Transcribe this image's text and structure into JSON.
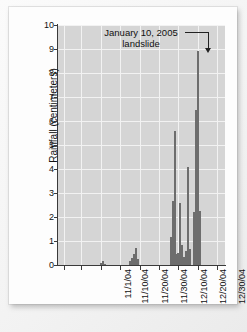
{
  "figure": {
    "background_color": "#fdfdfd",
    "plot_background_color": "#d5d5d5",
    "gridline_color": "#f2f2f2",
    "bar_color": "#6d6d6d",
    "axis_color": "#3a3a3a"
  },
  "annotation": {
    "line1": "January 10, 2005",
    "line2": "landslide"
  },
  "chart_data": {
    "type": "bar",
    "title": "",
    "subtitle": "",
    "xlabel": "",
    "ylabel": "Rainfall (centimeters)",
    "ylim": [
      0,
      10
    ],
    "ytick_labels": [
      "0",
      "1",
      "2",
      "3",
      "4",
      "5",
      "6",
      "7",
      "8",
      "9",
      "10"
    ],
    "ytick_values": [
      0,
      1,
      2,
      3,
      4,
      5,
      6,
      7,
      8,
      9,
      10
    ],
    "xtick_labels": [
      "11/1/04",
      "11/10/04",
      "11/20/04",
      "11/30/04",
      "12/10/04",
      "12/20/04",
      "12/30/04",
      "1/9/05",
      "1/19/05"
    ],
    "xtick_days": [
      0,
      9,
      19,
      29,
      39,
      49,
      59,
      69,
      79
    ],
    "xlim_days": [
      -3,
      83
    ],
    "grid": true,
    "legend": null,
    "annotations": [
      {
        "text": "January 10, 2005 landslide",
        "points_to_day": 70,
        "points_to_value": 8.9,
        "arrow": "down"
      }
    ],
    "categories": [
      "11/1/04",
      "11/2/04",
      "11/3/04",
      "11/4/04",
      "11/5/04",
      "11/6/04",
      "11/7/04",
      "11/8/04",
      "11/9/04",
      "11/10/04",
      "11/11/04",
      "11/12/04",
      "11/13/04",
      "11/14/04",
      "11/15/04",
      "11/16/04",
      "11/17/04",
      "11/18/04",
      "11/19/04",
      "11/20/04",
      "11/21/04",
      "11/22/04",
      "11/23/04",
      "11/24/04",
      "11/25/04",
      "11/26/04",
      "11/27/04",
      "11/28/04",
      "11/29/04",
      "11/30/04",
      "12/1/04",
      "12/2/04",
      "12/3/04",
      "12/4/04",
      "12/5/04",
      "12/6/04",
      "12/7/04",
      "12/8/04",
      "12/9/04",
      "12/10/04",
      "12/11/04",
      "12/12/04",
      "12/13/04",
      "12/14/04",
      "12/15/04",
      "12/16/04",
      "12/17/04",
      "12/18/04",
      "12/19/04",
      "12/20/04",
      "12/21/04",
      "12/22/04",
      "12/23/04",
      "12/24/04",
      "12/25/04",
      "12/26/04",
      "12/27/04",
      "12/28/04",
      "12/29/04",
      "12/30/04",
      "12/31/04",
      "1/1/05",
      "1/2/05",
      "1/3/05",
      "1/4/05",
      "1/5/05",
      "1/6/05",
      "1/7/05",
      "1/8/05",
      "1/9/05",
      "1/10/05",
      "1/11/05",
      "1/12/05",
      "1/13/05",
      "1/14/05",
      "1/15/05",
      "1/16/05",
      "1/17/05",
      "1/18/05",
      "1/19/05"
    ],
    "values": [
      0,
      0,
      0,
      0,
      0,
      0,
      0,
      0,
      0,
      0,
      0,
      0,
      0,
      0,
      0,
      0,
      0,
      0,
      0,
      0.1,
      0.15,
      0.05,
      0,
      0,
      0,
      0,
      0,
      0,
      0,
      0,
      0,
      0,
      0,
      0,
      0.15,
      0.3,
      0.45,
      0.7,
      0.25,
      0,
      0,
      0,
      0,
      0,
      0,
      0,
      0,
      0,
      0,
      0,
      0,
      0,
      0,
      0,
      0,
      1.15,
      2.65,
      5.6,
      0.45,
      0.5,
      2.6,
      0.85,
      0.35,
      0.6,
      4.1,
      0.65,
      0,
      2.2,
      6.45,
      8.9,
      2.25,
      0,
      0,
      0,
      0,
      0,
      0,
      0,
      0,
      0
    ]
  }
}
